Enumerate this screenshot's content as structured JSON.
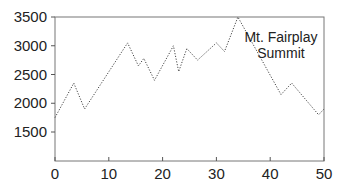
{
  "chart_data": {
    "type": "line",
    "title": "",
    "xlabel": "",
    "ylabel": "",
    "xlim": [
      0,
      50
    ],
    "ylim": [
      1000,
      3500
    ],
    "x_ticks": [
      0,
      10,
      20,
      30,
      40,
      50
    ],
    "y_ticks": [
      1500,
      2000,
      2500,
      3000,
      3500
    ],
    "grid": false,
    "legend": null,
    "line_style": "dotted",
    "annotations": [
      {
        "text_lines": [
          "Mt. Fairplay",
          "Summit"
        ],
        "x": 42,
        "y": 3300
      }
    ],
    "series": [
      {
        "name": "elevation",
        "x": [
          0,
          3.5,
          5.5,
          13.5,
          15.5,
          16.5,
          18.5,
          22,
          23,
          24.5,
          26.5,
          30,
          31.5,
          34,
          42,
          44,
          49,
          50
        ],
        "y": [
          1750,
          2350,
          1900,
          3050,
          2650,
          2780,
          2400,
          3000,
          2550,
          2950,
          2750,
          3050,
          2900,
          3500,
          2150,
          2350,
          1800,
          1900
        ]
      }
    ]
  }
}
